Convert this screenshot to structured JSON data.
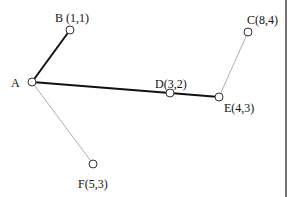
{
  "diagram": {
    "type": "graph",
    "nodes": [
      {
        "id": "A",
        "label": "A",
        "x": 32,
        "y": 82,
        "label_x": 11,
        "label_y": 87
      },
      {
        "id": "B",
        "label": "B (1,1)",
        "x": 70,
        "y": 30,
        "label_x": 55,
        "label_y": 22
      },
      {
        "id": "C",
        "label": "C(8,4)",
        "x": 248,
        "y": 32,
        "label_x": 247,
        "label_y": 24
      },
      {
        "id": "D",
        "label": "D(3,2)",
        "x": 170,
        "y": 93,
        "label_x": 155,
        "label_y": 88
      },
      {
        "id": "E",
        "label": "E(4,3)",
        "x": 219,
        "y": 97,
        "label_x": 224,
        "label_y": 112
      },
      {
        "id": "F",
        "label": "F(5,3)",
        "x": 93,
        "y": 164,
        "label_x": 78,
        "label_y": 188
      }
    ],
    "edges": [
      {
        "from": "A",
        "to": "B",
        "style": "thick",
        "color": "#111111"
      },
      {
        "from": "A",
        "to": "D",
        "style": "thick",
        "color": "#111111"
      },
      {
        "from": "D",
        "to": "E",
        "style": "thick",
        "color": "#111111"
      },
      {
        "from": "A",
        "to": "F",
        "style": "thin",
        "color": "#b0b0b0"
      },
      {
        "from": "E",
        "to": "C",
        "style": "thin",
        "color": "#b0b0b0"
      }
    ],
    "frame": {
      "right_border_x": 286
    }
  }
}
